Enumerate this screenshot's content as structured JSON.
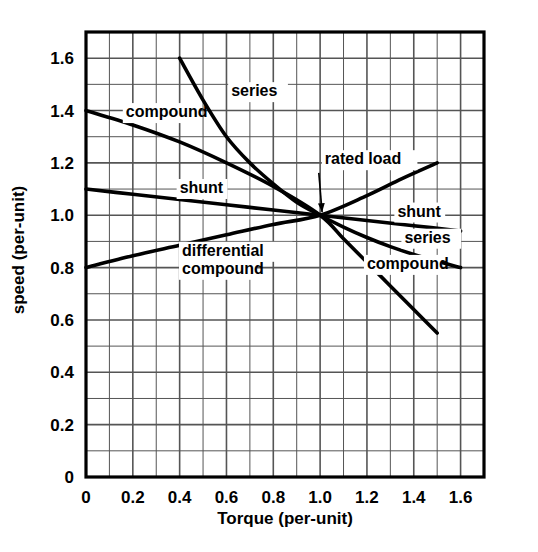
{
  "figure": {
    "background": "#ffffff",
    "ink": "#000000",
    "grid_color": "#555555"
  },
  "chart_data": {
    "type": "line",
    "title": "",
    "xlabel": "Torque (per-unit)",
    "ylabel": "speed (per-unit)",
    "xlim": [
      0,
      1.7
    ],
    "ylim": [
      0,
      1.7
    ],
    "xticks": [
      "0",
      "0.2",
      "0.4",
      "0.6",
      "0.8",
      "1.0",
      "1.2",
      "1.4",
      "1.6"
    ],
    "xtick_values": [
      0,
      0.2,
      0.4,
      0.6,
      0.8,
      1.0,
      1.2,
      1.4,
      1.6
    ],
    "yticks": [
      "0",
      "0.2",
      "0.4",
      "0.6",
      "0.8",
      "1.0",
      "1.2",
      "1.4",
      "1.6"
    ],
    "ytick_values": [
      0,
      0.2,
      0.4,
      0.6,
      0.8,
      1.0,
      1.2,
      1.4,
      1.6
    ],
    "grid": true,
    "minor_grid_step": 0.1,
    "major_grid_step": 0.2,
    "legend": "inline-labels",
    "series": [
      {
        "name": "series",
        "label_left": "series",
        "label_right": "series",
        "points": [
          [
            0.4,
            1.6
          ],
          [
            0.5,
            1.44
          ],
          [
            0.6,
            1.3
          ],
          [
            0.7,
            1.2
          ],
          [
            0.8,
            1.12
          ],
          [
            0.9,
            1.05
          ],
          [
            1.0,
            1.0
          ],
          [
            1.1,
            0.955
          ],
          [
            1.2,
            0.915
          ],
          [
            1.3,
            0.88
          ],
          [
            1.4,
            0.85
          ],
          [
            1.5,
            0.824
          ],
          [
            1.6,
            0.8
          ]
        ]
      },
      {
        "name": "compound",
        "label_left": "compound",
        "label_right": "compound",
        "points": [
          [
            0.0,
            1.4
          ],
          [
            0.2,
            1.345
          ],
          [
            0.4,
            1.28
          ],
          [
            0.6,
            1.2
          ],
          [
            0.8,
            1.11
          ],
          [
            1.0,
            1.0
          ],
          [
            1.1,
            0.91
          ],
          [
            1.2,
            0.82
          ],
          [
            1.3,
            0.73
          ],
          [
            1.4,
            0.64
          ],
          [
            1.5,
            0.55
          ]
        ]
      },
      {
        "name": "shunt",
        "label_left": "shunt",
        "label_right": "shunt",
        "points": [
          [
            0.0,
            1.1
          ],
          [
            0.2,
            1.08
          ],
          [
            0.4,
            1.06
          ],
          [
            0.6,
            1.04
          ],
          [
            0.8,
            1.02
          ],
          [
            1.0,
            1.0
          ],
          [
            1.2,
            0.98
          ],
          [
            1.4,
            0.96
          ],
          [
            1.6,
            0.94
          ]
        ]
      },
      {
        "name": "differential compound",
        "label_left": "differential\ncompound",
        "label_right": "",
        "points": [
          [
            0.0,
            0.8
          ],
          [
            0.2,
            0.845
          ],
          [
            0.4,
            0.885
          ],
          [
            0.6,
            0.925
          ],
          [
            0.8,
            0.965
          ],
          [
            1.0,
            1.0
          ],
          [
            1.2,
            1.075
          ],
          [
            1.35,
            1.14
          ],
          [
            1.5,
            1.2
          ]
        ]
      }
    ],
    "annotations": [
      {
        "name": "rated-load",
        "text": "rated load",
        "point": [
          1.0,
          1.0
        ],
        "text_position": [
          1.02,
          1.2
        ]
      }
    ]
  },
  "labels": {
    "series_left": "series",
    "compound_left": "compound",
    "shunt_left": "shunt",
    "differential_line1": "differential",
    "differential_line2": "compound",
    "shunt_right": "shunt",
    "series_right": "series",
    "compound_right": "compound",
    "rated_load": "rated load"
  }
}
